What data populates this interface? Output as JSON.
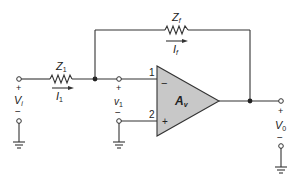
{
  "diagram": {
    "components": {
      "input_impedance": {
        "label": "Z",
        "subscript": "1"
      },
      "feedback_impedance": {
        "label": "Z",
        "subscript": "f"
      },
      "amplifier": {
        "label": "A",
        "subscript": "v"
      }
    },
    "currents": {
      "input_current": {
        "label": "I",
        "subscript": "1"
      },
      "feedback_current": {
        "label": "I",
        "subscript": "f"
      }
    },
    "voltages": {
      "input": {
        "label": "V",
        "subscript": "i",
        "plus": "+",
        "minus": "−"
      },
      "node": {
        "label": "v",
        "subscript": "1",
        "plus": "+",
        "minus": "−"
      },
      "output": {
        "label": "V",
        "subscript": "0",
        "plus": "+",
        "minus": "−"
      }
    },
    "opamp_pins": {
      "inverting": {
        "number": "1",
        "sign": "−"
      },
      "noninverting": {
        "number": "2",
        "sign": "+"
      }
    },
    "colors": {
      "opamp_fill": "#c8c8c8",
      "line": "#333333"
    }
  }
}
